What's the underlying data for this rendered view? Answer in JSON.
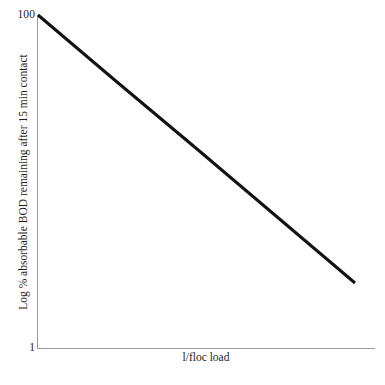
{
  "chart_data": {
    "type": "line",
    "title": "",
    "subtitle": "",
    "xlabel": "l/floc load",
    "ylabel": "Log % absorbable BOD remaining after 15 min contact",
    "y_tick_labels": [
      "100",
      "1"
    ],
    "x_tick_labels": [],
    "ylim": [
      1,
      100
    ],
    "y_scale": "log",
    "grid": false,
    "legend": null,
    "annotations": [],
    "series": [
      {
        "name": "absorbable BOD remaining",
        "color": "#121212",
        "line_width": 3,
        "x": [
          0.0,
          0.25,
          0.5,
          0.75,
          1.0
        ],
        "y": [
          100.0,
          42.0,
          17.8,
          7.5,
          3.2
        ],
        "points_px": [
          [
            38,
            15
          ],
          [
            117,
            82
          ],
          [
            197,
            149
          ],
          [
            276,
            216
          ],
          [
            355,
            283
          ]
        ]
      }
    ],
    "axes_color": "#9a9a9a",
    "background_color": "#ffffff"
  },
  "figure": {
    "y_axis_top_label": "100",
    "y_axis_bottom_label": "1",
    "y_axis_title": "Log % absorbable BOD remaining after 15 min contact",
    "x_axis_title": "l/floc load"
  }
}
